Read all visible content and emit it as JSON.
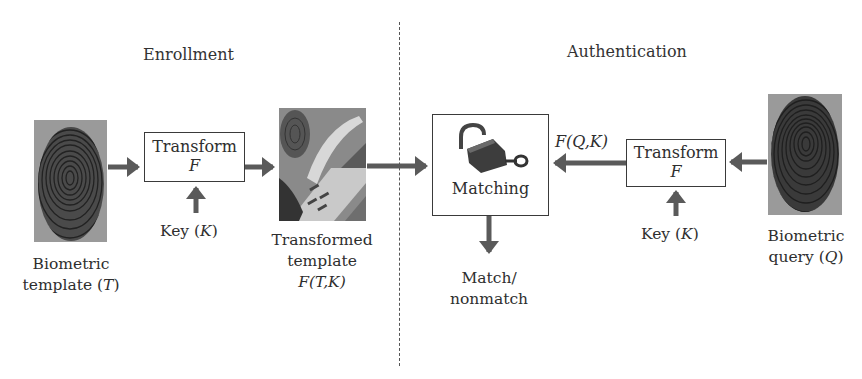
{
  "sections": {
    "enrollment": "Enrollment",
    "authentication": "Authentication"
  },
  "enrollment": {
    "biometric_template": {
      "line1": "Biometric",
      "line2_prefix": "template (",
      "var": "T",
      "line2_suffix": ")",
      "image": "fingerprint-image"
    },
    "transform": {
      "title": "Transform",
      "symbol": "F"
    },
    "key": {
      "prefix": "Key (",
      "var": "K",
      "suffix": ")"
    },
    "transformed_template": {
      "line1": "Transformed",
      "line2": "template",
      "formula": "F(T,K)",
      "image": "lock-fingerprint-image"
    }
  },
  "authentication": {
    "matching": {
      "title": "Matching",
      "icon": "padlock-key-icon"
    },
    "transformed_query_label": "F(Q,K)",
    "transform": {
      "title": "Transform",
      "symbol": "F"
    },
    "key": {
      "prefix": "Key (",
      "var": "K",
      "suffix": ")"
    },
    "biometric_query": {
      "line1": "Biometric",
      "line2_prefix": "query (",
      "var": "Q",
      "line2_suffix": ")",
      "image": "fingerprint-image"
    },
    "result": {
      "line1": "Match/",
      "line2": "nonmatch"
    }
  },
  "colors": {
    "arrow": "#5a5a5a",
    "box_border": "#3a3a3a",
    "text": "#2e2e2e",
    "fingerprint_bg": "#8c8c8c",
    "fingerprint_ridge": "#2b2b2b"
  }
}
